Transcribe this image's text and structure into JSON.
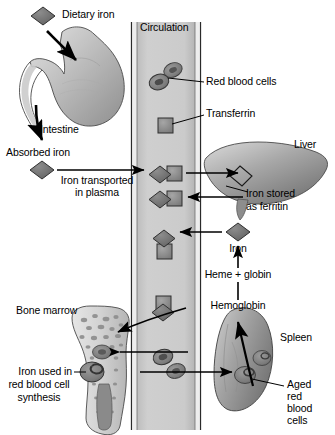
{
  "figure": {
    "type": "biological-process-diagram",
    "background_color": "#ffffff",
    "text_color": "#000000"
  },
  "palette": {
    "iron_diamond": "#707070",
    "transferrin_square": "#8a8a8a",
    "vessel_fill": "#c9c9c9",
    "vessel_wall": "#e8e8e8",
    "organ_light": "#d8d8d8",
    "organ_mid": "#9a9a9a",
    "organ_dark": "#6a6a6a",
    "rbc_fill": "#808080",
    "rbc_core": "#4a4a4a",
    "outline": "#1a1a1a"
  },
  "labels": {
    "dietary_iron": "Dietary iron",
    "intestine": "Intestine",
    "absorbed_iron": "Absorbed iron",
    "iron_transported_line1": "Iron transported",
    "iron_transported_line2": "in plasma",
    "circulation": "Circulation",
    "red_blood_cells": "Red blood cells",
    "transferrin": "Transferrin",
    "liver": "Liver",
    "iron_stored_line1": "Iron stored",
    "iron_stored_line2": "as ferritin",
    "iron": "Iron",
    "heme_globin": "Heme + globin",
    "hemoglobin": "Hemoglobin",
    "spleen": "Spleen",
    "aged_rbc_line1": "Aged",
    "aged_rbc_line2": "red",
    "aged_rbc_line3": "blood",
    "aged_rbc_line4": "cells",
    "bone_marrow": "Bone marrow",
    "iron_used_line1": "Iron used in",
    "iron_used_line2": "red blood cell",
    "iron_used_line3": "synthesis"
  },
  "structures": [
    {
      "name": "stomach",
      "organ": "stomach",
      "region": "upper-left"
    },
    {
      "name": "intestine",
      "organ": "small intestine",
      "region": "left"
    },
    {
      "name": "blood-vessel",
      "organ": "circulation",
      "region": "center-column"
    },
    {
      "name": "liver",
      "organ": "liver",
      "region": "right"
    },
    {
      "name": "spleen",
      "organ": "spleen",
      "region": "lower-right"
    },
    {
      "name": "bone-marrow",
      "organ": "long bone with marrow",
      "region": "lower-left"
    }
  ],
  "molecules": [
    {
      "name": "iron",
      "glyph": "diamond",
      "color": "#707070"
    },
    {
      "name": "transferrin",
      "glyph": "square",
      "color": "#8a8a8a"
    },
    {
      "name": "iron-transferrin-complex",
      "glyph": "diamond+square",
      "color": "#707070"
    },
    {
      "name": "red-blood-cell",
      "glyph": "biconcave-disc",
      "color": "#808080"
    }
  ],
  "flow": [
    {
      "from": "Dietary iron",
      "to": "Stomach / Intestine"
    },
    {
      "from": "Intestine",
      "to": "Absorbed iron"
    },
    {
      "from": "Absorbed iron",
      "to": "Circulation",
      "label": "Iron transported in plasma"
    },
    {
      "from": "Circulation",
      "to": "Liver",
      "label": "Iron stored as ferritin"
    },
    {
      "from": "Liver",
      "to": "Circulation"
    },
    {
      "from": "Circulation",
      "to": "Bone marrow",
      "label": "Iron used in red blood cell synthesis"
    },
    {
      "from": "Bone marrow",
      "to": "Circulation"
    },
    {
      "from": "Aged red blood cells",
      "to": "Spleen"
    },
    {
      "from": "Spleen",
      "to": "Hemoglobin"
    },
    {
      "from": "Hemoglobin",
      "to": "Heme + globin"
    },
    {
      "from": "Heme + globin",
      "to": "Iron"
    },
    {
      "from": "Iron",
      "to": "Circulation"
    }
  ]
}
